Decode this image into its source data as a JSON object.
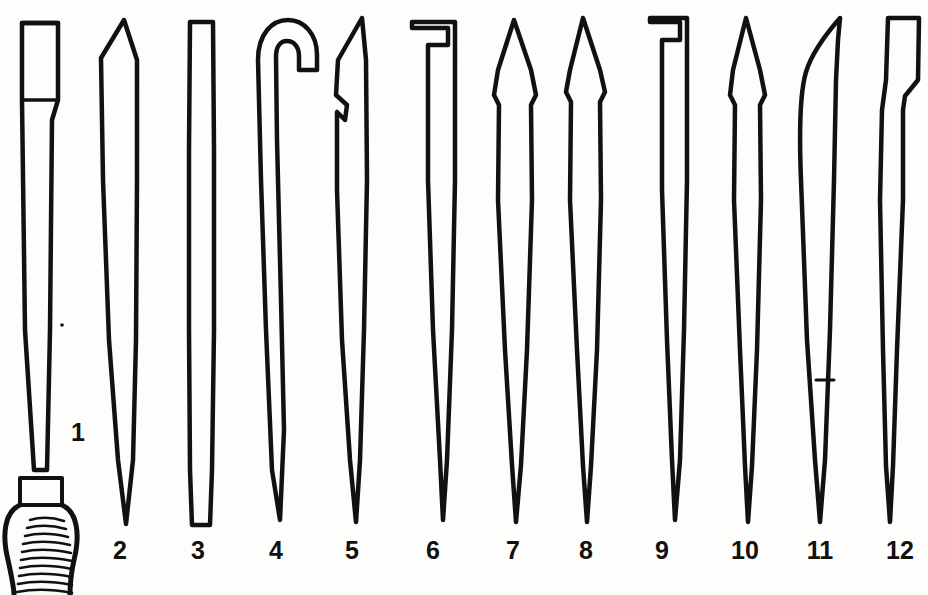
{
  "figure": {
    "kind": "line-drawing-plate",
    "background_color": "#fdfdfb",
    "ink_color": "#111111",
    "width": 928,
    "height": 595,
    "items": [
      {
        "number": "1",
        "label": "1",
        "label_x": 78,
        "label_y": 430,
        "shape": "broad flat chisel blade mounted in a bulbous hatched handle"
      },
      {
        "number": "2",
        "label": "2",
        "label_x": 120,
        "label_y": 548,
        "shape": "straight tapering blade with angled top"
      },
      {
        "number": "3",
        "label": "3",
        "label_x": 198,
        "label_y": 548,
        "shape": "narrow parallel-sided bar"
      },
      {
        "number": "4",
        "label": "4",
        "label_x": 276,
        "label_y": 548,
        "shape": "hooked head on long tapering shaft"
      },
      {
        "number": "5",
        "label": "5",
        "label_x": 352,
        "label_y": 548,
        "shape": "angled head with small notch, tapering shaft"
      },
      {
        "number": "6",
        "label": "6",
        "label_x": 433,
        "label_y": 548,
        "shape": "square hooked head, tapering shaft"
      },
      {
        "number": "7",
        "label": "7",
        "label_x": 513,
        "label_y": 548,
        "shape": "pointed leaf-shaped head, tapering shaft"
      },
      {
        "number": "8",
        "label": "8",
        "label_x": 586,
        "label_y": 548,
        "shape": "narrow pointed head, tapering shaft"
      },
      {
        "number": "9",
        "label": "9",
        "label_x": 662,
        "label_y": 548,
        "shape": "right-angled hook head, tapering shaft"
      },
      {
        "number": "10",
        "label": "10",
        "label_x": 745,
        "label_y": 548,
        "shape": "slender lance head, tapering shaft"
      },
      {
        "number": "11",
        "label": "11",
        "label_x": 820,
        "label_y": 548,
        "shape": "curved scalpel-like blade on tapering shaft"
      },
      {
        "number": "12",
        "label": "12",
        "label_x": 900,
        "label_y": 548,
        "shape": "straight blade with stepped shoulder, tapering shaft"
      }
    ]
  }
}
